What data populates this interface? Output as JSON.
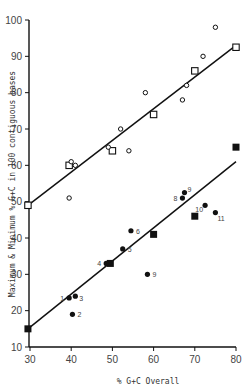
{
  "chart_data": {
    "type": "scatter",
    "title": "",
    "xlabel": "% G+C Overall",
    "ylabel": "Maximum & Minimum % G+C in 100 contiguous bases",
    "xlim": [
      29,
      80
    ],
    "ylim": [
      10,
      100
    ],
    "xticks": [
      30,
      40,
      50,
      60,
      70,
      80
    ],
    "yticks": [
      10,
      20,
      30,
      40,
      50,
      60,
      70,
      80,
      90,
      100
    ],
    "grid": false,
    "legend": null,
    "series": [
      {
        "name": "Maximum (open squares)",
        "marker": "open-square",
        "points": [
          [
            29.5,
            49
          ],
          [
            39.5,
            60
          ],
          [
            50,
            64
          ],
          [
            60,
            74
          ],
          [
            70,
            86
          ],
          [
            80,
            92.5
          ]
        ]
      },
      {
        "name": "Maximum (open circles)",
        "marker": "open-circle",
        "points": [
          [
            39.5,
            51
          ],
          [
            40,
            61
          ],
          [
            41,
            60
          ],
          [
            49,
            65
          ],
          [
            52,
            70
          ],
          [
            54,
            64
          ],
          [
            58,
            80
          ],
          [
            67,
            78
          ],
          [
            68,
            82
          ],
          [
            72,
            90
          ],
          [
            75,
            98
          ]
        ]
      },
      {
        "name": "Minimum (filled squares)",
        "marker": "filled-square",
        "points": [
          [
            29.5,
            15
          ],
          [
            49.5,
            33
          ],
          [
            60,
            41
          ],
          [
            70,
            46
          ],
          [
            80,
            65
          ]
        ]
      },
      {
        "name": "Minimum (filled circles)",
        "marker": "filled-circle",
        "points": [
          {
            "x": 39.5,
            "y": 23.5,
            "label": "1"
          },
          {
            "x": 40.3,
            "y": 19,
            "label": "2"
          },
          {
            "x": 41,
            "y": 24,
            "label": "3"
          },
          {
            "x": 48.5,
            "y": 33,
            "label": "4"
          },
          {
            "x": 52.5,
            "y": 37,
            "label": "5"
          },
          {
            "x": 54.5,
            "y": 42,
            "label": "6"
          },
          {
            "x": 58.5,
            "y": 30,
            "label": "9"
          },
          {
            "x": 67,
            "y": 51,
            "label": "8"
          },
          {
            "x": 67.5,
            "y": 52.5,
            "label": "9"
          },
          {
            "x": 72.5,
            "y": 49,
            "label": "10"
          },
          {
            "x": 75,
            "y": 47,
            "label": "11"
          }
        ]
      }
    ],
    "fit_lines": [
      {
        "name": "Maximum regression",
        "from": [
          29.5,
          49
        ],
        "to": [
          80,
          93
        ]
      },
      {
        "name": "Minimum regression",
        "from": [
          29.5,
          15
        ],
        "to": [
          80,
          61
        ]
      }
    ]
  }
}
